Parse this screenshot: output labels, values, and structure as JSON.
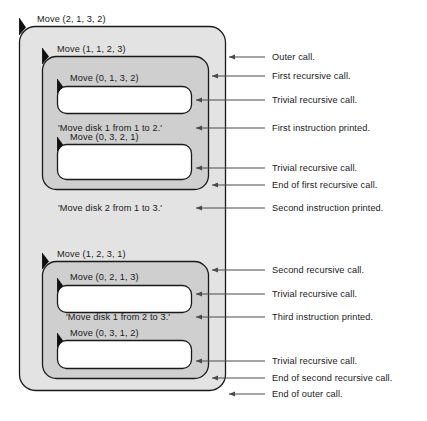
{
  "figure": {
    "type": "nested-box-recursion-trace"
  },
  "palette": {
    "level1_fill": "#e3e3e3",
    "level2_fill": "#cfcfcf",
    "level3_fill": "#c6c6c6",
    "trivial_fill": "#ffffff",
    "stroke": "#1a1a1a",
    "leader_line": "#4a4a4a",
    "text": "#1a1a1a"
  },
  "calls": {
    "outer": "Move (2, 1, 3, 2)",
    "first_recursive": "Move (1, 1, 2, 3)",
    "first_trivial_a": "Move (0, 1, 3, 2)",
    "first_trivial_b": "Move (0, 3, 2, 1)",
    "second_recursive": "Move (1, 2, 3, 1)",
    "second_trivial_a": "Move (0, 2, 1, 3)",
    "second_trivial_b": "Move (0, 3, 1, 2)"
  },
  "instructions": {
    "first": "'Move disk 1 from 1 to 2.'",
    "second": "'Move disk 2 from 1 to 3.'",
    "third": "'Move disk 1 from 2 to 3.'"
  },
  "annotations": [
    {
      "key": "outer-call",
      "text": "Outer call."
    },
    {
      "key": "first-recursive-call",
      "text": "First recursive call."
    },
    {
      "key": "trivial-recursive-call-1",
      "text": "Trivial recursive call."
    },
    {
      "key": "first-instruction",
      "text": "First instruction printed."
    },
    {
      "key": "trivial-recursive-call-2",
      "text": "Trivial recursive call."
    },
    {
      "key": "end-first-recursive-call",
      "text": "End of first recursive call."
    },
    {
      "key": "second-instruction",
      "text": "Second instruction printed."
    },
    {
      "key": "second-recursive-call",
      "text": "Second recursive call."
    },
    {
      "key": "trivial-recursive-call-3",
      "text": "Trivial recursive call."
    },
    {
      "key": "third-instruction",
      "text": "Third instruction printed."
    },
    {
      "key": "trivial-recursive-call-4",
      "text": "Trivial recursive call."
    },
    {
      "key": "end-second-recursive-call",
      "text": "End of second recursive call."
    },
    {
      "key": "end-outer-call",
      "text": "End of outer call."
    }
  ]
}
